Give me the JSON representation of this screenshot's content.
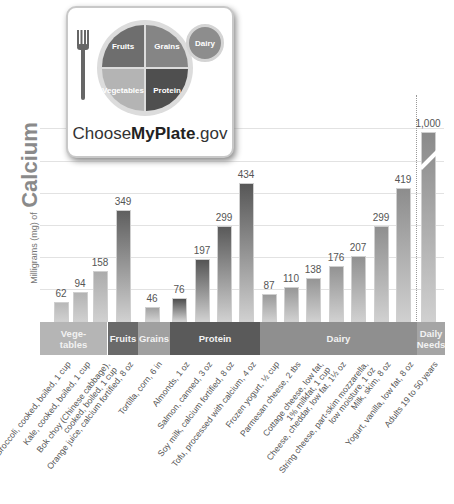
{
  "logo": {
    "sections": [
      "Fruits",
      "Grains",
      "Vegetables",
      "Protein"
    ],
    "dairy_label": "Dairy",
    "brand_prefix": "Choose",
    "brand_bold": "MyPlate",
    "brand_suffix": ".gov",
    "icon": "fork-icon"
  },
  "axis": {
    "ylabel_small": "Milligrams (mg) of",
    "ylabel_big": "Calcium"
  },
  "categories_band": [
    {
      "label": "Vege-\ntables",
      "color": "#b5b5b5"
    },
    {
      "label": "Fruits",
      "color": "#6a6a6a"
    },
    {
      "label": "Grains",
      "color": "#a0a0a0"
    },
    {
      "label": "Protein",
      "color": "#5a5a5a"
    },
    {
      "label": "Dairy",
      "color": "#8f8f8f"
    },
    {
      "label": "Daily\nNeeds",
      "color": "#a5a5a5"
    }
  ],
  "chart_data": {
    "type": "bar",
    "ylabel": "Milligrams (mg) of Calcium",
    "xlabel": "",
    "grid": true,
    "ylim": [
      0,
      500
    ],
    "axis_break": "Daily Needs bar broken (1,000 exceeds scale)",
    "categories": [
      "Broccoli, cooked, boiled, 1 cup",
      "Kale, cooked, boiled, 1 cup",
      "Bok choy (Chinese cabbage), cooked, boiled, 1 cup",
      "Orange juice, calcium fortified, 8 oz",
      "Tortilla, corn, 6 in",
      "Almonds, 1 oz",
      "Salmon, canned, 3 oz",
      "Soy milk, calcium fortified, 8 oz",
      "Tofu, processed with calcium, 4 oz",
      "Frozen yogurt, ½ cup",
      "Parmesan cheese, 2 tbs",
      "Cottage cheese, low fat, 1% milkfat, 1 cup",
      "Cheese, cheddar, low fat, 1½ oz",
      "String cheese, part-skim mozzarella, low moisture, 1 oz",
      "Milk, skim, 8 oz",
      "Yogurt, vanilla, low fat, 8 oz",
      "Adults 19 to 50 years"
    ],
    "values": [
      62,
      94,
      158,
      349,
      46,
      76,
      197,
      299,
      434,
      87,
      110,
      138,
      176,
      207,
      299,
      419,
      1000
    ],
    "value_labels": [
      "62",
      "94",
      "158",
      "349",
      "46",
      "76",
      "197",
      "299",
      "434",
      "87",
      "110",
      "138",
      "176",
      "207",
      "299",
      "419",
      "1,000"
    ],
    "groups": [
      "Vegetables",
      "Vegetables",
      "Vegetables",
      "Fruits",
      "Grains",
      "Protein",
      "Protein",
      "Protein",
      "Protein",
      "Dairy",
      "Dairy",
      "Dairy",
      "Dairy",
      "Dairy",
      "Dairy",
      "Dairy",
      "Daily Needs"
    ]
  },
  "bars": [
    {
      "x": 54,
      "h": 20,
      "color": "#b8b8b8",
      "label": "62",
      "xl": "Broccoli, cooked, boiled, 1 cup"
    },
    {
      "x": 73,
      "h": 30,
      "color": "#b3b3b3",
      "label": "94",
      "xl": "Kale, cooked, boiled, 1 cup"
    },
    {
      "x": 93,
      "h": 51,
      "color": "#acacac",
      "label": "158",
      "xl": "Bok choy (Chinese cabbage),\ncooked, boiled, 1 cup"
    },
    {
      "x": 116,
      "h": 112,
      "color": "#5f5f5f",
      "label": "349",
      "xl": "Orange juice, calcium fortified, 8 oz"
    },
    {
      "x": 145,
      "h": 15,
      "color": "#a2a2a2",
      "label": "46",
      "xl": "Tortilla, corn, 6 in"
    },
    {
      "x": 172,
      "h": 24,
      "color": "#4e4e4e",
      "label": "76",
      "xl": "Almonds, 1 oz"
    },
    {
      "x": 195,
      "h": 63,
      "color": "#555555",
      "label": "197",
      "xl": "Salmon, canned, 3 oz"
    },
    {
      "x": 217,
      "h": 96,
      "color": "#5a5a5a",
      "label": "299",
      "xl": "Soy milk, calcium fortified, 8 oz"
    },
    {
      "x": 239,
      "h": 139,
      "color": "#575757",
      "label": "434",
      "xl": "Tofu, processed with calcium, 4 oz"
    },
    {
      "x": 262,
      "h": 28,
      "color": "#9a9a9a",
      "label": "87",
      "xl": "Frozen yogurt, ½ cup"
    },
    {
      "x": 284,
      "h": 35,
      "color": "#979797",
      "label": "110",
      "xl": "Parmesan cheese, 2 tbs"
    },
    {
      "x": 306,
      "h": 44,
      "color": "#959595",
      "label": "138",
      "xl": "Cottage cheese, low fat,\n1% milkfat, 1 cup"
    },
    {
      "x": 329,
      "h": 56,
      "color": "#939393",
      "label": "176",
      "xl": "Cheese, cheddar, low fat, 1½ oz"
    },
    {
      "x": 351,
      "h": 66,
      "color": "#919191",
      "label": "207",
      "xl": "String cheese, part-skim mozzarella,\nlow moisture, 1 oz"
    },
    {
      "x": 374,
      "h": 96,
      "color": "#8f8f8f",
      "label": "299",
      "xl": "Milk, skim, 8 oz"
    },
    {
      "x": 396,
      "h": 134,
      "color": "#8d8d8d",
      "label": "419",
      "xl": "Yogurt, vanilla, low fat, 8 oz"
    },
    {
      "x": 421,
      "h": 190,
      "color": "#8a8a8a",
      "label": "1,000",
      "xl": "Adults 19 to 50 years"
    }
  ]
}
